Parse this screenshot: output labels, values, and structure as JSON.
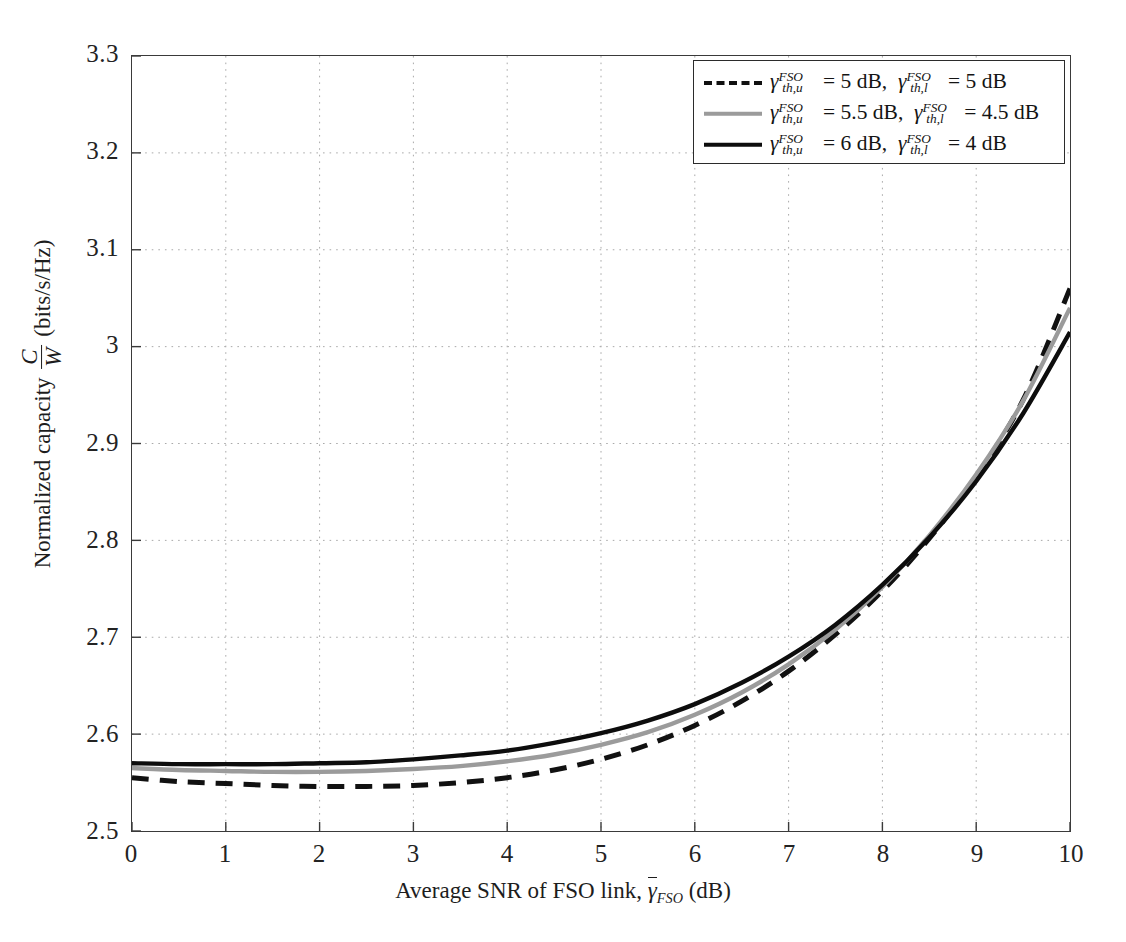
{
  "figure": {
    "title": "",
    "xlabel_prefix": "Average SNR of FSO link,",
    "xlabel_symbol": "γ",
    "xlabel_symbol_sub": "FSO",
    "xlabel_unit": "(dB)",
    "ylabel_prefix": "Normalized capacity",
    "ylabel_num": "C",
    "ylabel_den": "W",
    "ylabel_unit": "(bits/s/Hz)"
  },
  "legend": {
    "position": "top-right",
    "entries": [
      {
        "style": "dashed",
        "color": "#111111",
        "sym1": "γ",
        "sym1_sup": "FSO",
        "sym1_sub": "th,u",
        "val1": "5 dB",
        "sym2": "γ",
        "sym2_sup": "FSO",
        "sym2_sub": "th,l",
        "val2": "5 dB",
        "text": "γ_{th,u}^{FSO} = 5 dB, γ_{th,l}^{FSO} = 5 dB"
      },
      {
        "style": "solid",
        "color": "#9b9b9b",
        "sym1": "γ",
        "sym1_sup": "FSO",
        "sym1_sub": "th,u",
        "val1": "5.5 dB",
        "sym2": "γ",
        "sym2_sup": "FSO",
        "sym2_sub": "th,l",
        "val2": "4.5 dB",
        "text": "γ_{th,u}^{FSO} = 5.5 dB, γ_{th,l}^{FSO} = 4.5 dB"
      },
      {
        "style": "solid",
        "color": "#0d0d0d",
        "sym1": "γ",
        "sym1_sup": "FSO",
        "sym1_sub": "th,u",
        "val1": "6 dB",
        "sym2": "γ",
        "sym2_sup": "FSO",
        "sym2_sub": "th,l",
        "val2": "4 dB",
        "text": "γ_{th,u}^{FSO} = 6 dB, γ_{th,l}^{FSO} = 4 dB"
      }
    ]
  },
  "chart_data": {
    "type": "line",
    "title": "",
    "xlabel": "Average SNR of FSO link, γ̄_FSO (dB)",
    "ylabel": "Normalized capacity C/W (bits/s/Hz)",
    "xlim": [
      0,
      10
    ],
    "ylim": [
      2.5,
      3.3
    ],
    "xticks": [
      0,
      1,
      2,
      3,
      4,
      5,
      6,
      7,
      8,
      9,
      10
    ],
    "xticklabels": [
      "0",
      "1",
      "2",
      "3",
      "4",
      "5",
      "6",
      "7",
      "8",
      "9",
      "10"
    ],
    "yticks": [
      2.5,
      2.6,
      2.7,
      2.8,
      2.9,
      3.0,
      3.1,
      3.2,
      3.3
    ],
    "yticklabels": [
      "2.5",
      "2.6",
      "2.7",
      "2.8",
      "2.9",
      "3",
      "3.1",
      "3.2",
      "3.3"
    ],
    "grid": true,
    "grid_style": "dotted",
    "legend_position": "upper right",
    "x": [
      0,
      0.5,
      1,
      1.5,
      2,
      2.5,
      3,
      3.5,
      4,
      4.5,
      5,
      5.5,
      6,
      6.5,
      7,
      7.5,
      8,
      8.5,
      9,
      9.5,
      10
    ],
    "series": [
      {
        "name": "γ_{th,u}^{FSO} = 5 dB, γ_{th,l}^{FSO} = 5 dB",
        "style": "dashed",
        "color": "#111111",
        "values": [
          2.555,
          2.551,
          2.549,
          2.547,
          2.546,
          2.546,
          2.547,
          2.55,
          2.555,
          2.563,
          2.574,
          2.589,
          2.609,
          2.634,
          2.665,
          2.703,
          2.748,
          2.802,
          2.866,
          2.945,
          3.06
        ]
      },
      {
        "name": "γ_{th,u}^{FSO} = 5.5 dB, γ_{th,l}^{FSO} = 4.5 dB",
        "style": "solid",
        "color": "#9b9b9b",
        "values": [
          2.565,
          2.563,
          2.562,
          2.561,
          2.561,
          2.562,
          2.564,
          2.567,
          2.572,
          2.579,
          2.589,
          2.602,
          2.62,
          2.643,
          2.672,
          2.708,
          2.752,
          2.805,
          2.868,
          2.944,
          3.04
        ]
      },
      {
        "name": "γ_{th,u}^{FSO} = 6 dB, γ_{th,l}^{FSO} = 4 dB",
        "style": "solid",
        "color": "#0d0d0d",
        "values": [
          2.57,
          2.569,
          2.569,
          2.569,
          2.57,
          2.571,
          2.574,
          2.578,
          2.583,
          2.591,
          2.601,
          2.614,
          2.631,
          2.653,
          2.68,
          2.713,
          2.754,
          2.803,
          2.861,
          2.931,
          3.015
        ]
      }
    ]
  }
}
